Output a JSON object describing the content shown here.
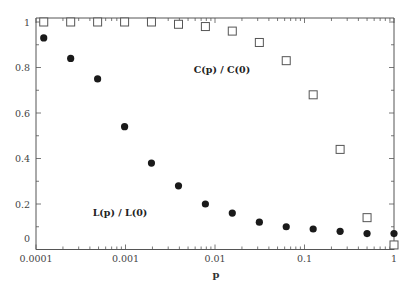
{
  "chart_data": {
    "type": "scatter",
    "title": "",
    "xlabel": "p",
    "ylabel": "",
    "xscale": "log",
    "xlim": [
      0.0001,
      1
    ],
    "ylim": [
      0,
      1
    ],
    "grid": false,
    "legend": "inline labels",
    "x_ticks": [
      "0.0001",
      "0.001",
      "0.01",
      "0.1",
      "1"
    ],
    "y_ticks": [
      "0",
      "0.2",
      "0.4",
      "0.6",
      "0.8",
      "1"
    ],
    "x": [
      0.000122,
      0.000244,
      0.000488,
      0.000977,
      0.00195,
      0.00391,
      0.00781,
      0.0156,
      0.0313,
      0.0625,
      0.125,
      0.25,
      0.5,
      1.0
    ],
    "series": [
      {
        "name": "C(p) / C(0)",
        "marker": "open-square",
        "values": [
          1.0,
          1.0,
          1.0,
          1.0,
          1.0,
          0.99,
          0.98,
          0.96,
          0.91,
          0.83,
          0.68,
          0.44,
          0.14,
          0.02
        ]
      },
      {
        "name": "L(p) / L(0)",
        "marker": "filled-circle",
        "values": [
          0.93,
          0.84,
          0.75,
          0.54,
          0.38,
          0.28,
          0.2,
          0.16,
          0.12,
          0.1,
          0.09,
          0.08,
          0.07,
          0.07
        ]
      }
    ],
    "annotations": [
      {
        "text": "C(p) / C(0)",
        "x": 0.01,
        "y": 0.8
      },
      {
        "text": "L(p) / L(0)",
        "x": 0.0015,
        "y": 0.17
      }
    ]
  }
}
